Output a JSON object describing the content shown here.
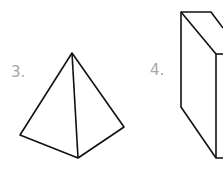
{
  "figures": [
    {
      "label": "3.",
      "shape": "pyramid"
    },
    {
      "label": "4.",
      "shape": "rectangular-prism"
    }
  ],
  "colors": {
    "stroke": "#111111",
    "label": "#a8a8a8",
    "background": "#ffffff"
  }
}
